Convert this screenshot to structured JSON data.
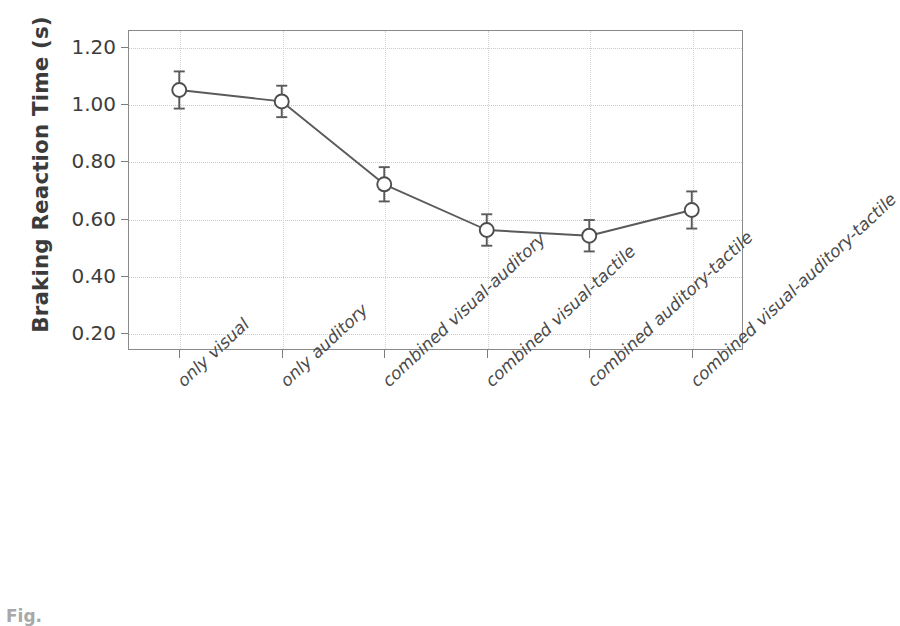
{
  "figure": {
    "caption_stub": "Fig."
  },
  "chart_data": {
    "type": "line",
    "title": "",
    "xlabel": "",
    "ylabel": "Braking Reaction Time (s)",
    "ylim": [
      0.14,
      1.26
    ],
    "yticks": [
      "0.20",
      "0.40",
      "0.60",
      "0.80",
      "1.00",
      "1.20"
    ],
    "ytick_values": [
      0.2,
      0.4,
      0.6,
      0.8,
      1.0,
      1.2
    ],
    "grid": true,
    "legend": "none",
    "marker": "open-circle",
    "error_bars": "standard-error",
    "categories": [
      "only visual",
      "only auditory",
      "combined visual-auditory",
      "combined visual-tactile",
      "combined auditory-tactile",
      "combined visual-auditory-tactile"
    ],
    "values": [
      1.05,
      1.01,
      0.72,
      0.56,
      0.54,
      0.63
    ],
    "errors": [
      0.065,
      0.055,
      0.06,
      0.055,
      0.055,
      0.065
    ],
    "series": [
      {
        "name": "Braking Reaction Time",
        "values": [
          1.05,
          1.01,
          0.72,
          0.56,
          0.54,
          0.63
        ],
        "errors": [
          0.065,
          0.055,
          0.06,
          0.055,
          0.055,
          0.065
        ]
      }
    ],
    "colors": {
      "line": "#5a5a5a",
      "marker_fill": "#ffffff",
      "marker_stroke": "#4d4d4d",
      "axis": "#8a8a8a",
      "grid": "#c9c9c9",
      "text": "#3d3d3d"
    }
  }
}
